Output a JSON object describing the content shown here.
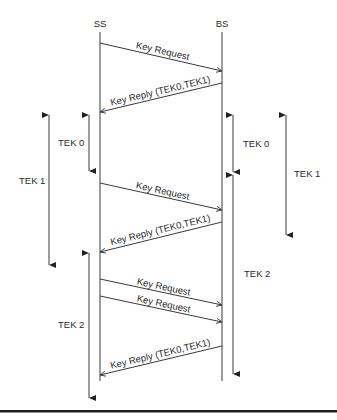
{
  "entities": [
    {
      "id": "ss",
      "label": "SS",
      "x": 100
    },
    {
      "id": "bs",
      "label": "BS",
      "x": 222
    }
  ],
  "messages": [
    {
      "label": "Key Request",
      "from": "ss",
      "to": "bs",
      "y1": 43,
      "y2": 71
    },
    {
      "label": "Key Reply (TEK0,TEK1)",
      "from": "bs",
      "to": "ss",
      "y1": 83,
      "y2": 112
    },
    {
      "label": "Key Request",
      "from": "ss",
      "to": "bs",
      "y1": 183,
      "y2": 210
    },
    {
      "label": "Key Reply (TEK0,TEK1)",
      "from": "bs",
      "to": "ss",
      "y1": 222,
      "y2": 252
    },
    {
      "label": "Key Request",
      "from": "ss",
      "to": "bs",
      "y1": 279,
      "y2": 305
    },
    {
      "label": "Key Request",
      "from": "ss",
      "to": "bs",
      "y1": 296,
      "y2": 322
    },
    {
      "label": "Key Reply (TEK0,TEK1)",
      "from": "bs",
      "to": "ss",
      "y1": 346,
      "y2": 375
    }
  ],
  "lifetimes": {
    "ss_side": [
      {
        "label": "TEK 0",
        "x": 89,
        "y1": 115,
        "y2": 171
      },
      {
        "label": "TEK 1",
        "x": 49,
        "y1": 115,
        "y2": 265
      },
      {
        "label": "TEK 2",
        "x": 89,
        "y1": 253,
        "y2": 398
      }
    ],
    "bs_side": [
      {
        "label": "TEK 0",
        "x": 233,
        "y1": 115,
        "y2": 172
      },
      {
        "label": "TEK 1",
        "x": 286,
        "y1": 115,
        "y2": 235
      },
      {
        "label": "TEK 2",
        "x": 233,
        "y1": 175,
        "y2": 374
      }
    ]
  },
  "colors": {
    "ink": "#3a3a3a",
    "background": "#ffffff"
  }
}
